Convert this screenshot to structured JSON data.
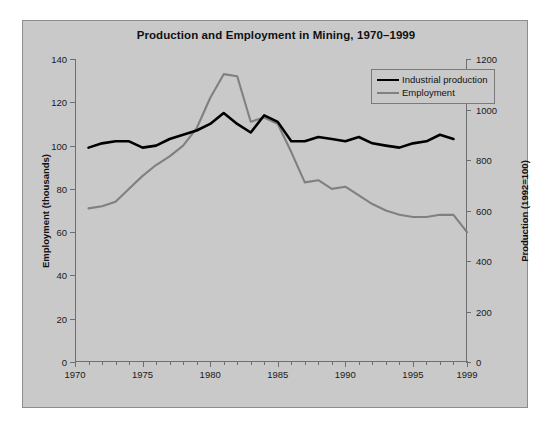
{
  "chart_data": {
    "type": "line",
    "title": "Production and Employment in Mining, 1970–1999",
    "xlabel": "",
    "ylabel": "Employment (thousands)",
    "y2label": "Production (1992=100)",
    "xlim": [
      1970,
      1999
    ],
    "ylim": [
      0,
      140
    ],
    "y2lim": [
      0,
      1200
    ],
    "xticks": [
      1970,
      1975,
      1980,
      1985,
      1990,
      1995,
      1999
    ],
    "xtick_labels": [
      "1970",
      "1975",
      "1980",
      "1985",
      "1990",
      "1995",
      "1999"
    ],
    "yticks": [
      0,
      20,
      40,
      60,
      80,
      100,
      120,
      140
    ],
    "ytick_labels": [
      "0",
      "20",
      "40",
      "60",
      "80",
      "100",
      "120",
      "140"
    ],
    "y2ticks": [
      0,
      200,
      400,
      600,
      800,
      1000,
      1200
    ],
    "y2tick_labels": [
      "0",
      "200",
      "400",
      "600",
      "800",
      "1000",
      "1200"
    ],
    "grid": false,
    "legend_position": "top-right",
    "x": [
      1971,
      1972,
      1973,
      1974,
      1975,
      1976,
      1977,
      1978,
      1979,
      1980,
      1981,
      1982,
      1983,
      1984,
      1985,
      1986,
      1987,
      1988,
      1989,
      1990,
      1991,
      1992,
      1993,
      1994,
      1995,
      1996,
      1997,
      1998
    ],
    "series": [
      {
        "name": "Industrial production",
        "axis": "right",
        "units": "1992=100",
        "color": "#000000",
        "values_index": [
          99,
          101,
          102,
          102,
          99,
          100,
          103,
          105,
          107,
          110,
          115,
          110,
          106,
          114,
          111,
          102,
          102,
          104,
          103,
          102,
          104,
          101,
          100,
          99,
          101,
          102,
          105,
          103
        ],
        "values_production": [
          849,
          866,
          874,
          874,
          849,
          857,
          883,
          900,
          917,
          943,
          986,
          943,
          909,
          977,
          951,
          874,
          874,
          891,
          883,
          874,
          891,
          866,
          857,
          849,
          866,
          874,
          900,
          883
        ]
      },
      {
        "name": "Employment",
        "axis": "left",
        "units": "thousands",
        "color": "#808080",
        "values": [
          71,
          72,
          74,
          80,
          86,
          91,
          95,
          100,
          108,
          122,
          133,
          132,
          111,
          113,
          110,
          97,
          83,
          84,
          80,
          81,
          77,
          73,
          70,
          68,
          67,
          67,
          68,
          68
        ]
      }
    ],
    "series_endpoint_note": {
      "employment_1999": 60
    }
  },
  "legend": {
    "items": [
      {
        "label": "Industrial production",
        "color": "#000000"
      },
      {
        "label": "Employment",
        "color": "#808080"
      }
    ]
  },
  "colors": {
    "background": "#ffffff",
    "chart_background": "#c9c9c9",
    "frame_border": "#8d8d8d",
    "axis": "#6e6e6e",
    "production_line": "#000000",
    "employment_line": "#808080",
    "text": "#111111"
  }
}
